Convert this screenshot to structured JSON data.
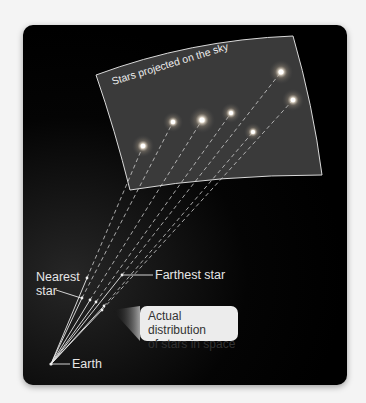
{
  "figure": {
    "title": "Stars projected on the sky",
    "labels": {
      "sky_caption": "Stars projected on the sky",
      "nearest_line1": "Nearest",
      "nearest_line2": "star",
      "farthest": "Farthest star",
      "callout_line1": "Actual distribution",
      "callout_line2": "of stars in space",
      "earth": "Earth"
    },
    "colors": {
      "background": "#000000",
      "sky_sheet": "#3a3a3a",
      "sheet_border": "#d9d9d9",
      "line": "#e0e0e0",
      "callout_bg": "#ececec",
      "callout_text": "#333333",
      "page": "#f4f4f4"
    },
    "earth_point": [
      51,
      364
    ],
    "projected_stars": [
      {
        "x": 143,
        "y": 146,
        "size": 1.0
      },
      {
        "x": 173,
        "y": 122,
        "size": 0.9
      },
      {
        "x": 202,
        "y": 120,
        "size": 1.2
      },
      {
        "x": 231,
        "y": 113,
        "size": 0.9
      },
      {
        "x": 253,
        "y": 132,
        "size": 0.85
      },
      {
        "x": 281,
        "y": 72,
        "size": 1.1
      },
      {
        "x": 293,
        "y": 100,
        "size": 1.0
      }
    ],
    "actual_stars": [
      {
        "x": 87,
        "y": 278
      },
      {
        "x": 82,
        "y": 298
      },
      {
        "x": 90,
        "y": 300
      },
      {
        "x": 96,
        "y": 302
      },
      {
        "x": 104,
        "y": 306
      },
      {
        "x": 122,
        "y": 275
      },
      {
        "x": 102,
        "y": 310
      }
    ]
  }
}
